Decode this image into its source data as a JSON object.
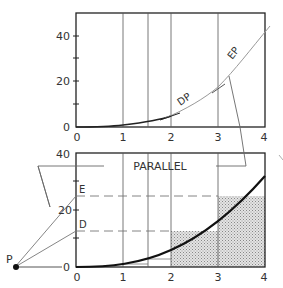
{
  "top_plot": {
    "y_ticks": [
      "0",
      "20",
      "40"
    ],
    "x_ticks": [
      "0",
      "1",
      "2",
      "3",
      "4"
    ],
    "label_dp": "DP",
    "label_ep": "EP"
  },
  "bottom_plot": {
    "y_ticks": [
      "0",
      "40"
    ],
    "y_mid_tick": "20",
    "x_ticks": [
      "0",
      "1",
      "2",
      "3",
      "4"
    ],
    "label_e": "E",
    "label_d": "D",
    "label_p": "P",
    "label_parallel": "PARALLEL",
    "p_zero": "0"
  },
  "colors": {
    "line": "#222222",
    "grid": "#555555",
    "thin": "#888888",
    "shade": "#cfcfcf"
  }
}
